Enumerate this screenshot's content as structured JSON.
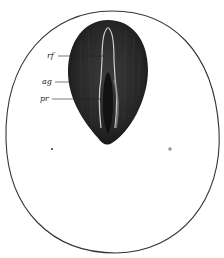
{
  "figure": {
    "labels": [
      {
        "id": "rf",
        "text": "rf",
        "x": 47,
        "y": 53
      },
      {
        "id": "ag",
        "text": "ag",
        "x": 42,
        "y": 79
      },
      {
        "id": "pr",
        "text": "pr",
        "x": 40,
        "y": 96
      }
    ],
    "colors": {
      "outline": "#333333",
      "embryo_dark": "#1e1e1e",
      "embryo_mid": "#3a3a3a",
      "streak_light": "#bdbdbd",
      "background": "#ffffff"
    }
  }
}
